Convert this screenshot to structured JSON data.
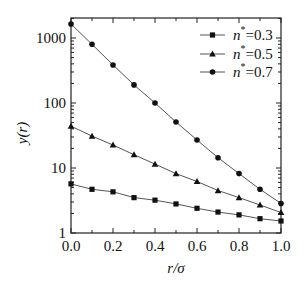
{
  "chart_data": {
    "type": "line",
    "title": "",
    "xlabel": "r/σ",
    "ylabel": "y(r)",
    "yscale": "log",
    "xlim": [
      0.0,
      1.0
    ],
    "ylim": [
      1,
      2000
    ],
    "xticks": [
      "0.0",
      "0.2",
      "0.4",
      "0.6",
      "0.8",
      "1.0"
    ],
    "yticks": [
      "1",
      "10",
      "100",
      "1000"
    ],
    "grid": false,
    "legend_position": "upper right",
    "x": [
      0.0,
      0.1,
      0.2,
      0.3,
      0.4,
      0.5,
      0.6,
      0.7,
      0.8,
      0.9,
      1.0
    ],
    "series": [
      {
        "name": "n*=0.3",
        "label_var": "n",
        "label_sup": "*",
        "label_val": "=0.3",
        "marker": "square",
        "values": [
          5.7,
          4.7,
          4.3,
          3.5,
          3.2,
          2.8,
          2.4,
          2.1,
          1.9,
          1.66,
          1.53
        ]
      },
      {
        "name": "n*=0.5",
        "label_var": "n",
        "label_sup": "*",
        "label_val": "=0.5",
        "marker": "triangle",
        "values": [
          44,
          31,
          22.6,
          16,
          11.5,
          8.2,
          6.2,
          4.5,
          3.5,
          2.7,
          2.07
        ]
      },
      {
        "name": "n*=0.7",
        "label_var": "n",
        "label_sup": "*",
        "label_val": "=0.7",
        "marker": "circle",
        "values": [
          1640,
          800,
          385,
          190,
          100,
          51,
          27,
          14.4,
          8.2,
          4.7,
          2.85
        ]
      }
    ]
  },
  "colors": {
    "line": "#555555",
    "marker": "#111111",
    "axis": "#222222"
  }
}
